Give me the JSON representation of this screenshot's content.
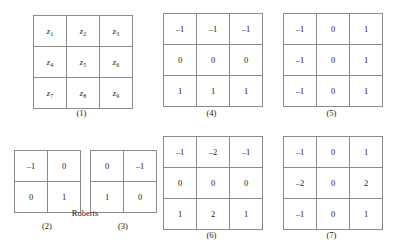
{
  "figure": {
    "group_labels": {
      "roberts": "Roberts"
    },
    "captions": {
      "neighborhood": "(1)",
      "roberts_gx": "(2)",
      "roberts_gy": "(3)",
      "prewitt_gx": "(4)",
      "prewitt_gy": "(5)",
      "sobel_gx": "(6)",
      "sobel_gy": "(7)"
    }
  },
  "chart_data": {
    "type": "table",
    "grids": [
      {
        "id": "neighborhood",
        "caption": "(1)",
        "rows": 3,
        "cols": 3,
        "symbolic": true,
        "cells": [
          [
            "z1",
            "z2",
            "z3"
          ],
          [
            "z4",
            "z5",
            "z6"
          ],
          [
            "z7",
            "z8",
            "z9"
          ]
        ],
        "base": "z",
        "subscripts": [
          [
            "1",
            "2",
            "3"
          ],
          [
            "4",
            "5",
            "6"
          ],
          [
            "7",
            "8",
            "9"
          ]
        ]
      },
      {
        "id": "roberts_gx",
        "caption": "(2)",
        "group": "Roberts",
        "rows": 2,
        "cols": 2,
        "symbolic": false,
        "cells": [
          [
            "–1",
            "0"
          ],
          [
            "0",
            "1"
          ]
        ]
      },
      {
        "id": "roberts_gy",
        "caption": "(3)",
        "group": "Roberts",
        "rows": 2,
        "cols": 2,
        "symbolic": false,
        "cells": [
          [
            "0",
            "–1"
          ],
          [
            "1",
            "0"
          ]
        ]
      },
      {
        "id": "prewitt_gx",
        "caption": "(4)",
        "rows": 3,
        "cols": 3,
        "symbolic": false,
        "cells": [
          [
            "–1",
            "–1",
            "–1"
          ],
          [
            "0",
            "0",
            "0"
          ],
          [
            "1",
            "1",
            "1"
          ]
        ]
      },
      {
        "id": "prewitt_gy",
        "caption": "(5)",
        "rows": 3,
        "cols": 3,
        "symbolic": false,
        "cells": [
          [
            "–1",
            "0",
            "1"
          ],
          [
            "–1",
            "0",
            "1"
          ],
          [
            "–1",
            "0",
            "1"
          ]
        ]
      },
      {
        "id": "sobel_gx",
        "caption": "(6)",
        "rows": 3,
        "cols": 3,
        "symbolic": false,
        "cells": [
          [
            "–1",
            "–2",
            "–1"
          ],
          [
            "0",
            "0",
            "0"
          ],
          [
            "1",
            "2",
            "1"
          ]
        ]
      },
      {
        "id": "sobel_gy",
        "caption": "(7)",
        "rows": 3,
        "cols": 3,
        "symbolic": false,
        "cells": [
          [
            "–1",
            "0",
            "1"
          ],
          [
            "–2",
            "0",
            "2"
          ],
          [
            "–1",
            "0",
            "1"
          ]
        ]
      }
    ],
    "colors": {
      "background": "#ffffff",
      "grid_line": "#8a8a8a",
      "text": "#1a1a1a"
    }
  }
}
